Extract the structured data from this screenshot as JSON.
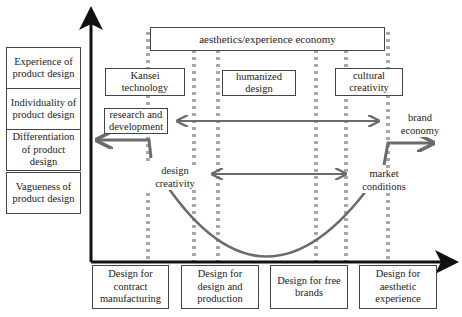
{
  "diagram": {
    "y_axis_boxes": [
      {
        "label": "Experience of product design"
      },
      {
        "label": "Individuality of product design"
      },
      {
        "label": "Differentiation of product design"
      },
      {
        "label": "Vagueness of product design"
      }
    ],
    "x_axis_boxes": [
      {
        "label": "Design for contract manufacturing"
      },
      {
        "label": "Design for design and production"
      },
      {
        "label": "Design for free brands"
      },
      {
        "label": "Design for aesthetic experience"
      }
    ],
    "top_box": {
      "label": "aesthetics/experience economy"
    },
    "mid_boxes": [
      {
        "label": "Kansei technology"
      },
      {
        "label": "humanized design"
      },
      {
        "label": "cultural creativity"
      }
    ],
    "research_box": {
      "label": "research and development"
    },
    "labels": {
      "brand_economy": "brand economy",
      "design_creativity": "design creativity",
      "market_conditions": "market conditions"
    },
    "colors": {
      "axis": "#111111",
      "arrow": "#6b6b6b",
      "dots": "#a8a8a8",
      "box_border": "#444444"
    }
  }
}
